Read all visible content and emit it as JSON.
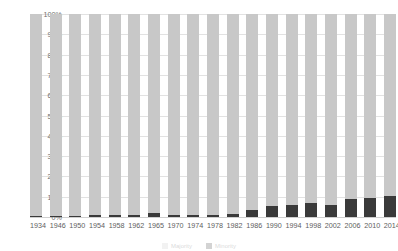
{
  "chart_data": {
    "type": "bar",
    "subtype": "stacked-100-percent",
    "title": "",
    "xlabel": "",
    "ylabel": "",
    "ylim": [
      0,
      100
    ],
    "yticks": [
      0,
      10,
      20,
      30,
      40,
      50,
      60,
      70,
      80,
      90,
      100
    ],
    "ytick_labels": [
      "0%",
      "10%",
      "20%",
      "30%",
      "40%",
      "50%",
      "60%",
      "70%",
      "80%",
      "90%",
      "100%"
    ],
    "grid": true,
    "legend_position": "bottom",
    "categories": [
      "1934",
      "1946",
      "1950",
      "1954",
      "1958",
      "1962",
      "1965",
      "1970",
      "1974",
      "1978",
      "1982",
      "1986",
      "1990",
      "1994",
      "1998",
      "2002",
      "2006",
      "2010",
      "2014"
    ],
    "series": [
      {
        "name": "Minority share",
        "color": "#3a3a3a",
        "values": [
          0.6,
          0.6,
          0.6,
          1.2,
          0.8,
          1.0,
          2.0,
          0.8,
          0.8,
          1.2,
          1.6,
          3.5,
          5.5,
          6.0,
          7.0,
          6.0,
          9.0,
          9.5,
          10.5
        ]
      },
      {
        "name": "Majority share",
        "color": "#c8c8c8",
        "values": [
          99.4,
          99.4,
          99.4,
          98.8,
          99.2,
          99.0,
          98.0,
          99.2,
          99.2,
          98.8,
          98.4,
          96.5,
          94.5,
          94.0,
          93.0,
          94.0,
          91.0,
          90.5,
          89.5
        ]
      }
    ]
  },
  "axis": {
    "y_ticks": [
      "100%",
      "90%",
      "80%",
      "70%",
      "60%",
      "50%",
      "40%",
      "30%",
      "20%",
      "10%",
      "0%"
    ],
    "x_ticks": [
      "1934",
      "1946",
      "1950",
      "1954",
      "1958",
      "1962",
      "1965",
      "1970",
      "1974",
      "1978",
      "1982",
      "1986",
      "1990",
      "1994",
      "1998",
      "2002",
      "2006",
      "2010",
      "2014"
    ]
  },
  "legend": {
    "items": [
      {
        "label": "Majority",
        "color": "#c8c8c8"
      },
      {
        "label": "Minority",
        "color": "#3a3a3a"
      }
    ]
  },
  "colors": {
    "major": "#c8c8c8",
    "minor": "#3a3a3a",
    "grid": "#e2e2e2",
    "text": "#6e6e6e"
  }
}
